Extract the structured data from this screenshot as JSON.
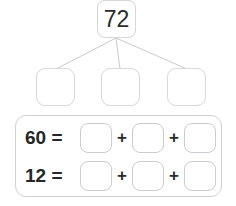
{
  "worksheet": {
    "title": "number-bond-decomposition",
    "colors": {
      "box_border": "#d7d9db",
      "panel_border": "#cfd2d4",
      "line": "#c8cacc",
      "text": "#262626",
      "background": "#ffffff"
    }
  },
  "number_bond": {
    "root": {
      "value": "72",
      "filled": true
    },
    "parts": [
      {
        "value": "",
        "filled": false
      },
      {
        "value": "",
        "filled": false
      },
      {
        "value": "",
        "filled": false
      }
    ],
    "branch_count": 3
  },
  "equations": [
    {
      "label": "60 =",
      "sum": "60",
      "operator": "+",
      "blanks": [
        "",
        "",
        ""
      ]
    },
    {
      "label": "12 =",
      "sum": "12",
      "operator": "+",
      "blanks": [
        "",
        "",
        ""
      ]
    }
  ]
}
